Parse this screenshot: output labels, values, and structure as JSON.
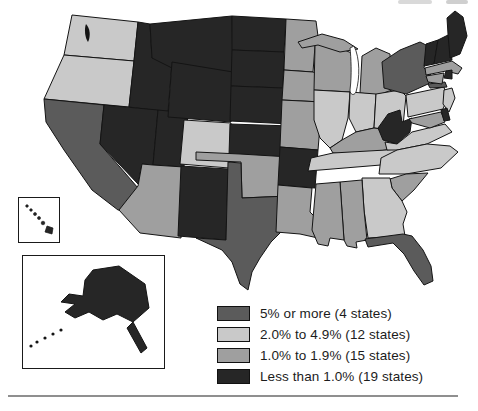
{
  "page": {
    "background": "#ffffff"
  },
  "legend": {
    "items": [
      {
        "key": "dark5",
        "label": "5% or more (4 states)",
        "color": "#5b5b5b",
        "count": 4
      },
      {
        "key": "light",
        "label": "2.0% to 4.9% (12 states)",
        "color": "#c9c9c9",
        "count": 12
      },
      {
        "key": "medium",
        "label": "1.0% to 1.9% (15 states)",
        "color": "#9f9f9f",
        "count": 15
      },
      {
        "key": "black",
        "label": "Less than 1.0% (19 states)",
        "color": "#262626",
        "count": 19
      }
    ]
  },
  "chart_data": {
    "type": "choropleth",
    "title": "",
    "legend_position": "bottom-right",
    "categories": {
      "dark5": {
        "label": "5% or more (4 states)",
        "color": "#5b5b5b"
      },
      "light": {
        "label": "2.0% to 4.9% (12 states)",
        "color": "#c9c9c9"
      },
      "medium": {
        "label": "1.0% to 1.9% (15 states)",
        "color": "#9f9f9f"
      },
      "black": {
        "label": "Less than 1.0% (19 states)",
        "color": "#262626"
      }
    },
    "stroke_color": "#141414",
    "states": [
      {
        "id": "WA",
        "category": "light"
      },
      {
        "id": "OR",
        "category": "light"
      },
      {
        "id": "CA",
        "category": "dark5"
      },
      {
        "id": "ID",
        "category": "black"
      },
      {
        "id": "NV",
        "category": "black"
      },
      {
        "id": "UT",
        "category": "black"
      },
      {
        "id": "AZ",
        "category": "medium"
      },
      {
        "id": "MT",
        "category": "black"
      },
      {
        "id": "WY",
        "category": "black"
      },
      {
        "id": "CO",
        "category": "light"
      },
      {
        "id": "NM",
        "category": "black"
      },
      {
        "id": "ND",
        "category": "black"
      },
      {
        "id": "SD",
        "category": "black"
      },
      {
        "id": "NE",
        "category": "black"
      },
      {
        "id": "KS",
        "category": "black"
      },
      {
        "id": "OK",
        "category": "medium"
      },
      {
        "id": "TX",
        "category": "dark5"
      },
      {
        "id": "MN",
        "category": "medium"
      },
      {
        "id": "IA",
        "category": "medium"
      },
      {
        "id": "MO",
        "category": "medium"
      },
      {
        "id": "AR",
        "category": "black"
      },
      {
        "id": "LA",
        "category": "medium"
      },
      {
        "id": "WI",
        "category": "medium"
      },
      {
        "id": "IL",
        "category": "light"
      },
      {
        "id": "MIUP",
        "category": "medium"
      },
      {
        "id": "MI",
        "category": "medium"
      },
      {
        "id": "IN",
        "category": "light"
      },
      {
        "id": "OH",
        "category": "light"
      },
      {
        "id": "KY",
        "category": "medium"
      },
      {
        "id": "TN",
        "category": "light"
      },
      {
        "id": "WV",
        "category": "black"
      },
      {
        "id": "VA",
        "category": "light"
      },
      {
        "id": "NC",
        "category": "light"
      },
      {
        "id": "SC",
        "category": "medium"
      },
      {
        "id": "GA",
        "category": "light"
      },
      {
        "id": "AL",
        "category": "medium"
      },
      {
        "id": "MS",
        "category": "medium"
      },
      {
        "id": "FL",
        "category": "dark5"
      },
      {
        "id": "PA",
        "category": "light"
      },
      {
        "id": "NY",
        "category": "dark5"
      },
      {
        "id": "LI",
        "category": "dark5"
      },
      {
        "id": "VT",
        "category": "black"
      },
      {
        "id": "NH",
        "category": "black"
      },
      {
        "id": "ME",
        "category": "black"
      },
      {
        "id": "MA",
        "category": "medium"
      },
      {
        "id": "CT",
        "category": "medium"
      },
      {
        "id": "RI",
        "category": "black"
      },
      {
        "id": "NJ",
        "category": "light"
      },
      {
        "id": "MD",
        "category": "medium"
      },
      {
        "id": "DE",
        "category": "black"
      },
      {
        "id": "AK",
        "category": "black"
      },
      {
        "id": "HI",
        "category": "black"
      }
    ]
  }
}
